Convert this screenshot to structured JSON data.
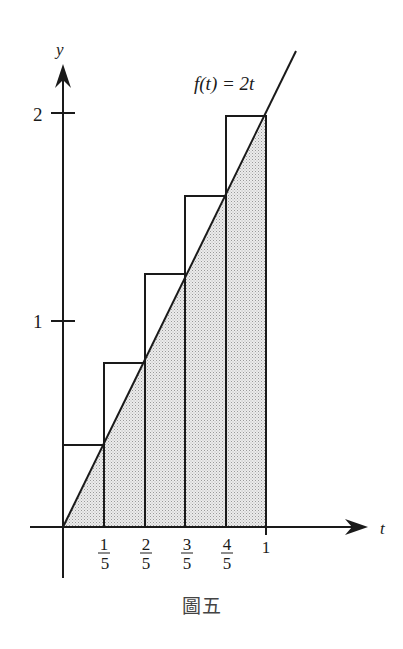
{
  "figure": {
    "caption": "圖五",
    "function_label": "f(t) = 2t",
    "x_axis_label": "t",
    "y_axis_label": "y",
    "y_ticks": [
      {
        "value": 1,
        "label": "1"
      },
      {
        "value": 2,
        "label": "2"
      }
    ],
    "x_ticks": [
      {
        "value": 0.2,
        "num": "1",
        "den": "5"
      },
      {
        "value": 0.4,
        "num": "2",
        "den": "5"
      },
      {
        "value": 0.6,
        "num": "3",
        "den": "5"
      },
      {
        "value": 0.8,
        "num": "4",
        "den": "5"
      },
      {
        "value": 1.0,
        "label": "1"
      }
    ],
    "rectangles": [
      {
        "x0": 0.0,
        "x1": 0.2,
        "height": 0.4
      },
      {
        "x0": 0.2,
        "x1": 0.4,
        "height": 0.8
      },
      {
        "x0": 0.4,
        "x1": 0.6,
        "height": 1.2
      },
      {
        "x0": 0.6,
        "x1": 0.8,
        "height": 1.6
      },
      {
        "x0": 0.8,
        "x1": 1.0,
        "height": 2.0
      }
    ],
    "shaded_region": "area under f(t)=2t from t=0 to t=1",
    "colors": {
      "ink": "#1a1a1a",
      "shade": "#d9d9d9",
      "background": "#ffffff"
    }
  }
}
